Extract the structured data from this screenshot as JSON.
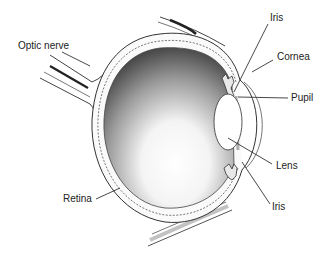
{
  "diagram": {
    "labels": {
      "optic_nerve": "Optic nerve",
      "iris_top": "Iris",
      "cornea": "Cornea",
      "pupil": "Pupil",
      "lens": "Lens",
      "iris_bottom": "Iris",
      "retina": "Retina"
    },
    "colors": {
      "background": "#ffffff",
      "line": "#333333",
      "text": "#222222",
      "interior_dark": "#4a4a4a",
      "interior_light": "#ffffff"
    }
  }
}
